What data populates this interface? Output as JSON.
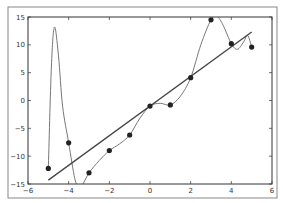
{
  "chart_data": {
    "type": "scatter",
    "title": "",
    "xlabel": "",
    "ylabel": "",
    "xlim": [
      -6,
      6
    ],
    "ylim": [
      -15,
      15
    ],
    "grid": false,
    "legend": null,
    "xticks": [
      -6,
      -4,
      -2,
      0,
      2,
      4,
      6
    ],
    "yticks": [
      -15,
      -10,
      -5,
      0,
      5,
      10,
      15
    ],
    "xtick_labels": [
      "−6",
      "−4",
      "−2",
      "0",
      "2",
      "4",
      "6"
    ],
    "ytick_labels": [
      "−15",
      "−10",
      "−5",
      "0",
      "5",
      "10",
      "15"
    ],
    "series": [
      {
        "name": "data points",
        "kind": "scatter",
        "x": [
          -5,
          -4,
          -3,
          -2,
          -1,
          0,
          1,
          2,
          3,
          4,
          5
        ],
        "y": [
          -12.2,
          -7.6,
          -13,
          -9,
          -6.2,
          -1,
          -0.8,
          4.1,
          14.5,
          10.2,
          9.6
        ],
        "color": "#222222"
      },
      {
        "name": "linear fit",
        "kind": "line",
        "x": [
          -5,
          5
        ],
        "y": [
          -14.3,
          12.3
        ],
        "color": "#444444"
      },
      {
        "name": "interpolating polynomial",
        "kind": "line",
        "x": [
          -5,
          -4.85,
          -4.7,
          -4.5,
          -4.3,
          -4,
          -3.7,
          -3.5,
          -3.3,
          -3,
          -2.5,
          -2,
          -1.5,
          -1,
          -0.5,
          0,
          0.5,
          1,
          1.5,
          2,
          2.5,
          3,
          3.3,
          3.6,
          4,
          4.3,
          4.6,
          4.8,
          5
        ],
        "y": [
          -12.2,
          6,
          13.2,
          8,
          -1,
          -7.6,
          -14,
          -15.5,
          -15,
          -13,
          -10.8,
          -9,
          -7.8,
          -6.2,
          -3.2,
          -1,
          -0.5,
          -0.8,
          0.8,
          4.1,
          10,
          14.5,
          15.1,
          13.5,
          10.2,
          9.2,
          10.5,
          11.7,
          9.6
        ],
        "color": "#777777"
      }
    ]
  }
}
